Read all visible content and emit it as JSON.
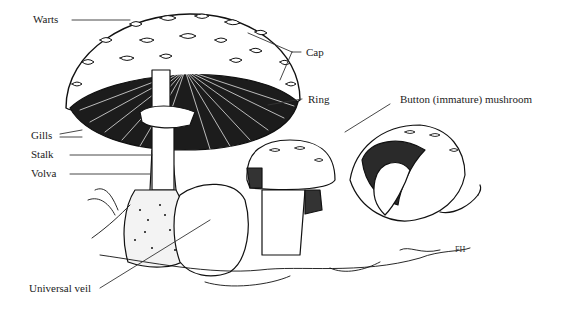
{
  "diagram": {
    "labels": [
      {
        "id": "warts",
        "text": "Warts",
        "x": 33,
        "y": 13
      },
      {
        "id": "cap",
        "text": "Cap",
        "x": 311,
        "y": 46
      },
      {
        "id": "ring",
        "text": "Ring",
        "x": 311,
        "y": 93
      },
      {
        "id": "button",
        "text": "Button (immature) mushroom",
        "x": 400,
        "y": 93
      },
      {
        "id": "gills",
        "text": "Gills",
        "x": 31,
        "y": 130
      },
      {
        "id": "stalk",
        "text": "Stalk",
        "x": 31,
        "y": 149
      },
      {
        "id": "volva",
        "text": "Volva",
        "x": 31,
        "y": 168
      },
      {
        "id": "universal-veil",
        "text": "Universal veil",
        "x": 29,
        "y": 283
      }
    ],
    "signature": "FH"
  }
}
